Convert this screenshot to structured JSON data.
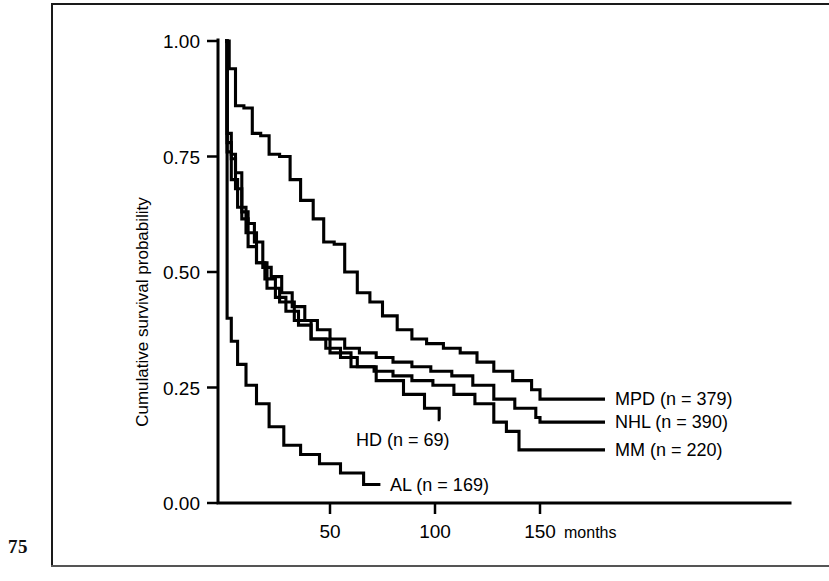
{
  "page": {
    "folio": "75"
  },
  "chart_data": {
    "type": "line",
    "title": "",
    "subtitle": "",
    "xlabel": "months",
    "ylabel": "Cumulative survival probability",
    "xlim": [
      0,
      175
    ],
    "ylim": [
      0.0,
      1.0
    ],
    "grid": false,
    "legend_position": "inline-right-of-curve-ends",
    "x_ticks": [
      50,
      100,
      150
    ],
    "x_tick_labels": [
      "50",
      "100",
      "150"
    ],
    "x_unit_label": "months",
    "y_ticks": [
      0.0,
      0.25,
      0.5,
      0.75,
      1.0
    ],
    "y_tick_labels": [
      "0.00",
      "0.25",
      "0.50",
      "0.75",
      "1.00"
    ],
    "step_type": "post",
    "series": [
      {
        "name": "MPD",
        "label": "MPD (n = 379)",
        "n": 379,
        "color": "#000000",
        "end_label_y": 0.225,
        "x": [
          0,
          2,
          5,
          9,
          13,
          17,
          21,
          26,
          31,
          36,
          42,
          47,
          52,
          57,
          63,
          69,
          75,
          82,
          89,
          96,
          104,
          112,
          120,
          128,
          137,
          146,
          150
        ],
        "y": [
          1.0,
          0.94,
          0.86,
          0.855,
          0.8,
          0.795,
          0.755,
          0.75,
          0.7,
          0.655,
          0.615,
          0.565,
          0.56,
          0.5,
          0.455,
          0.435,
          0.405,
          0.375,
          0.355,
          0.345,
          0.335,
          0.325,
          0.305,
          0.285,
          0.265,
          0.245,
          0.225
        ]
      },
      {
        "name": "NHL",
        "label": "NHL (n = 390)",
        "n": 390,
        "color": "#000000",
        "end_label_y": 0.175,
        "x": [
          0,
          1,
          3,
          5,
          8,
          11,
          14,
          18,
          22,
          27,
          32,
          38,
          44,
          50,
          57,
          64,
          72,
          80,
          89,
          98,
          108,
          118,
          128,
          138,
          148,
          150
        ],
        "y": [
          1.0,
          0.8,
          0.755,
          0.715,
          0.63,
          0.605,
          0.565,
          0.51,
          0.49,
          0.455,
          0.425,
          0.395,
          0.375,
          0.355,
          0.335,
          0.325,
          0.315,
          0.305,
          0.295,
          0.285,
          0.275,
          0.255,
          0.225,
          0.205,
          0.185,
          0.175
        ]
      },
      {
        "name": "MM",
        "label": "MM (n = 220)",
        "n": 220,
        "color": "#000000",
        "end_label_y": 0.115,
        "x": [
          0,
          1,
          3,
          5,
          8,
          11,
          15,
          19,
          24,
          29,
          35,
          41,
          48,
          55,
          63,
          71,
          80,
          89,
          99,
          109,
          119,
          128,
          134,
          140,
          150
        ],
        "y": [
          1.0,
          0.78,
          0.745,
          0.68,
          0.615,
          0.555,
          0.52,
          0.485,
          0.445,
          0.415,
          0.385,
          0.355,
          0.335,
          0.315,
          0.295,
          0.285,
          0.275,
          0.265,
          0.255,
          0.235,
          0.215,
          0.175,
          0.155,
          0.115,
          0.115
        ]
      },
      {
        "name": "HD",
        "label": "HD (n = 69)",
        "n": 69,
        "color": "#000000",
        "end_label_y": 0.18,
        "x": [
          0,
          1,
          3,
          6,
          10,
          15,
          20,
          26,
          33,
          41,
          50,
          60,
          72,
          85,
          95,
          102
        ],
        "y": [
          1.0,
          0.76,
          0.7,
          0.64,
          0.585,
          0.52,
          0.465,
          0.435,
          0.395,
          0.355,
          0.325,
          0.295,
          0.265,
          0.235,
          0.205,
          0.18
        ]
      },
      {
        "name": "AL",
        "label": "AL (n = 169)",
        "n": 169,
        "color": "#000000",
        "end_label_y": 0.04,
        "x": [
          0,
          1,
          3,
          6,
          10,
          15,
          21,
          28,
          36,
          45,
          55,
          66,
          74
        ],
        "y": [
          1.0,
          0.4,
          0.35,
          0.3,
          0.255,
          0.215,
          0.165,
          0.125,
          0.105,
          0.085,
          0.065,
          0.04,
          0.04
        ]
      }
    ]
  }
}
